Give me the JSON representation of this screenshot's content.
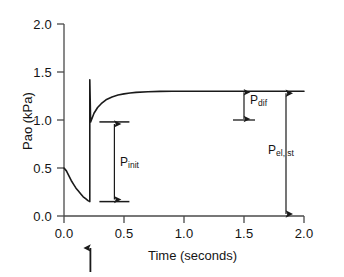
{
  "chart_data": {
    "type": "line",
    "title": "",
    "xlabel": "Time (seconds)",
    "ylabel": "Pao (kPa)",
    "xlim": [
      0.0,
      2.0
    ],
    "ylim": [
      0.0,
      2.0
    ],
    "grid": false,
    "legend": "none",
    "x_ticks": [
      "0.0",
      "0.5",
      "1.0",
      "1.5",
      "2.0"
    ],
    "y_ticks": [
      "0.0",
      "0.5",
      "1.0",
      "1.5",
      "2.0"
    ],
    "x_tick_values": [
      0.0,
      0.5,
      1.0,
      1.5,
      2.0
    ],
    "y_tick_values": [
      0.0,
      0.5,
      1.0,
      1.5,
      2.0
    ],
    "series": [
      {
        "name": "Pao",
        "description": "Airway opening pressure: exponential decay during inspiration, occlusion spike, then stress relaxation to plateau",
        "points": [
          [
            0.0,
            0.5
          ],
          [
            0.02,
            0.47
          ],
          [
            0.04,
            0.42
          ],
          [
            0.06,
            0.37
          ],
          [
            0.08,
            0.33
          ],
          [
            0.1,
            0.29
          ],
          [
            0.12,
            0.26
          ],
          [
            0.14,
            0.23
          ],
          [
            0.16,
            0.2
          ],
          [
            0.18,
            0.18
          ],
          [
            0.2,
            0.16
          ],
          [
            0.215,
            0.15
          ],
          [
            0.215,
            1.42
          ],
          [
            0.222,
            0.98
          ],
          [
            0.25,
            1.07
          ],
          [
            0.28,
            1.13
          ],
          [
            0.31,
            1.17
          ],
          [
            0.35,
            1.21
          ],
          [
            0.4,
            1.24
          ],
          [
            0.45,
            1.26
          ],
          [
            0.5,
            1.272
          ],
          [
            0.55,
            1.281
          ],
          [
            0.6,
            1.288
          ],
          [
            0.7,
            1.294
          ],
          [
            0.8,
            1.298
          ],
          [
            0.9,
            1.299
          ],
          [
            1.0,
            1.3
          ],
          [
            1.25,
            1.3
          ],
          [
            1.5,
            1.3
          ],
          [
            1.75,
            1.3
          ],
          [
            2.0,
            1.3
          ]
        ]
      }
    ],
    "key_values": {
      "start_pressure": 0.5,
      "minimum_pressure": 0.15,
      "occlusion_time": 0.215,
      "peak_spike_pressure": 1.42,
      "post_spike_pressure": 0.98,
      "plateau_pressure": 1.3
    },
    "annotations": [
      {
        "id": "p-init",
        "label": "P",
        "subscript": "init",
        "kind": "double-arrow-vertical",
        "x": 0.42,
        "y_from": 0.15,
        "y_to": 0.98,
        "value": 0.83
      },
      {
        "id": "p-dif",
        "label": "P",
        "subscript": "dif",
        "kind": "double-arrow-vertical",
        "x": 1.5,
        "y_from": 1.0,
        "y_to": 1.3,
        "value": 0.3
      },
      {
        "id": "p-el-st",
        "label": "P",
        "subscript": "el, st",
        "kind": "double-arrow-vertical",
        "x": 1.85,
        "y_from": 0.0,
        "y_to": 1.3,
        "value": 1.3
      },
      {
        "id": "occlusion-marker",
        "label": "",
        "kind": "up-arrow-below-axis",
        "x": 0.22,
        "note": "occlusion event marker"
      }
    ],
    "colors": {
      "curve": "#1a1a1a",
      "axis": "#4a4a4a",
      "annotation": "#1a1a1a",
      "background": "#ffffff"
    }
  }
}
